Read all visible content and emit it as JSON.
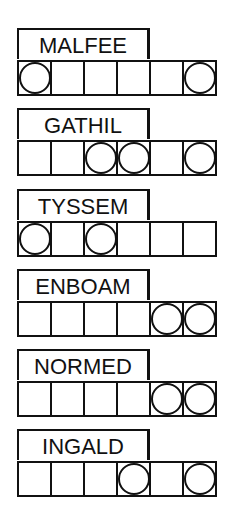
{
  "puzzles": [
    {
      "scrambled": "MALFEE",
      "cells": 6,
      "circled": [
        1,
        6
      ]
    },
    {
      "scrambled": "GATHIL",
      "cells": 6,
      "circled": [
        3,
        4,
        6
      ]
    },
    {
      "scrambled": "TYSSEM",
      "cells": 6,
      "circled": [
        1,
        3
      ]
    },
    {
      "scrambled": "ENBOAM",
      "cells": 6,
      "circled": [
        5,
        6
      ]
    },
    {
      "scrambled": "NORMED",
      "cells": 6,
      "circled": [
        5,
        6
      ]
    },
    {
      "scrambled": "INGALD",
      "cells": 6,
      "circled": [
        4,
        6
      ]
    }
  ],
  "colors": {
    "ink": "#111111",
    "background": "#ffffff"
  }
}
